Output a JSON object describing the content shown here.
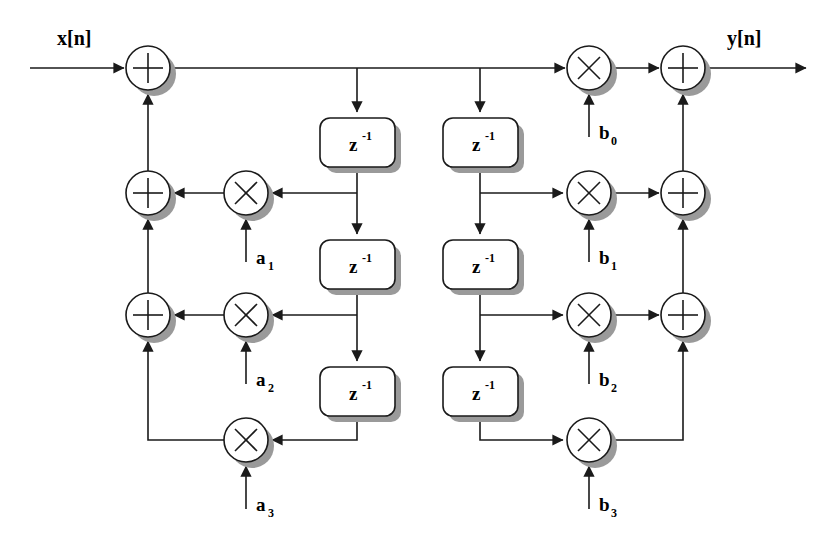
{
  "diagram": {
    "colors": {
      "line": "#1a1a1a",
      "shadow": "#9a9a9a",
      "fill": "#ffffff",
      "background": "#ffffff"
    },
    "io": {
      "input_label": "x[n]",
      "output_label": "y[n]"
    },
    "delay_blocks": [
      {
        "id": "z-left-1",
        "label": "z",
        "exponent": "-1",
        "x": 320,
        "y": 118,
        "w": 75,
        "h": 49
      },
      {
        "id": "z-left-2",
        "label": "z",
        "exponent": "-1",
        "x": 320,
        "y": 240,
        "w": 75,
        "h": 49
      },
      {
        "id": "z-left-3",
        "label": "z",
        "exponent": "-1",
        "x": 320,
        "y": 367,
        "w": 75,
        "h": 49
      },
      {
        "id": "z-right-1",
        "label": "z",
        "exponent": "-1",
        "x": 443,
        "y": 118,
        "w": 75,
        "h": 49
      },
      {
        "id": "z-right-2",
        "label": "z",
        "exponent": "-1",
        "x": 443,
        "y": 240,
        "w": 75,
        "h": 49
      },
      {
        "id": "z-right-3",
        "label": "z",
        "exponent": "-1",
        "x": 443,
        "y": 367,
        "w": 75,
        "h": 49
      }
    ],
    "adders": [
      {
        "id": "adder-input",
        "cx": 148,
        "cy": 68,
        "r": 22
      },
      {
        "id": "adder-fb-1",
        "cx": 148,
        "cy": 193,
        "r": 22
      },
      {
        "id": "adder-fb-2",
        "cx": 148,
        "cy": 315,
        "r": 22
      },
      {
        "id": "adder-out-0",
        "cx": 683,
        "cy": 68,
        "r": 22
      },
      {
        "id": "adder-out-1",
        "cx": 683,
        "cy": 193,
        "r": 22
      },
      {
        "id": "adder-out-2",
        "cx": 683,
        "cy": 315,
        "r": 22
      }
    ],
    "multipliers": [
      {
        "id": "mul-a1",
        "coef": "a",
        "sub": "1",
        "cx": 246,
        "cy": 193,
        "r": 22
      },
      {
        "id": "mul-a2",
        "coef": "a",
        "sub": "2",
        "cx": 246,
        "cy": 315,
        "r": 22
      },
      {
        "id": "mul-a3",
        "coef": "a",
        "sub": "3",
        "cx": 246,
        "cy": 440,
        "r": 22
      },
      {
        "id": "mul-b0",
        "coef": "b",
        "sub": "0",
        "cx": 589,
        "cy": 68,
        "r": 22
      },
      {
        "id": "mul-b1",
        "coef": "b",
        "sub": "1",
        "cx": 589,
        "cy": 193,
        "r": 22
      },
      {
        "id": "mul-b2",
        "coef": "b",
        "sub": "2",
        "cx": 589,
        "cy": 315,
        "r": 22
      },
      {
        "id": "mul-b3",
        "coef": "b",
        "sub": "3",
        "cx": 589,
        "cy": 440,
        "r": 22
      }
    ],
    "coefficient_labels": [
      {
        "id": "label-a1",
        "base": "a",
        "sub": "1",
        "x": 256,
        "y": 264
      },
      {
        "id": "label-a2",
        "base": "a",
        "sub": "2",
        "x": 256,
        "y": 386
      },
      {
        "id": "label-a3",
        "base": "a",
        "sub": "3",
        "x": 256,
        "y": 511
      },
      {
        "id": "label-b0",
        "base": "b",
        "sub": "0",
        "x": 599,
        "y": 139
      },
      {
        "id": "label-b1",
        "base": "b",
        "sub": "1",
        "x": 599,
        "y": 264
      },
      {
        "id": "label-b2",
        "base": "b",
        "sub": "2",
        "x": 599,
        "y": 386
      },
      {
        "id": "label-b3",
        "base": "b",
        "sub": "3",
        "x": 599,
        "y": 511
      }
    ]
  }
}
